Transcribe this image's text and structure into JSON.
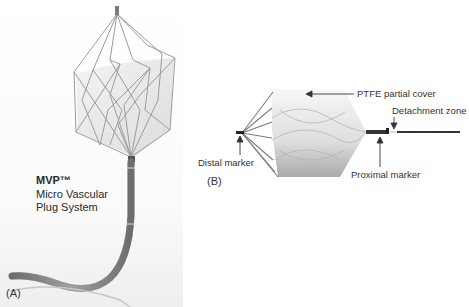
{
  "panel_a": {
    "letter": "(A)",
    "product_name": "MVP™",
    "product_line1": "Micro Vascular",
    "product_line2": "Plug System"
  },
  "panel_b": {
    "letter": "(B)",
    "labels": {
      "ptfe": "PTFE partial cover",
      "detachment": "Detachment zone",
      "distal": "Distal marker",
      "proximal": "Proximal marker"
    }
  },
  "colors": {
    "wire": "#9a9a9a",
    "cover": "#ececec",
    "catheter": "#8a8a8a",
    "marker": "#222222"
  }
}
